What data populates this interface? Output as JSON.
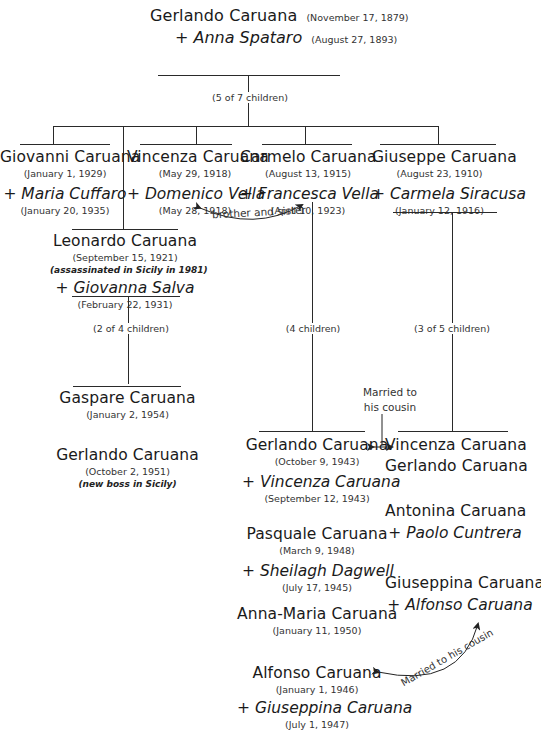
{
  "root": {
    "name": "Gerlando Caruana",
    "date": "(November 17, 1879)",
    "spouse": "+ Anna Spataro",
    "spouse_date": "(August 27, 1893)",
    "children_count": "(5 of 7 children)"
  },
  "generation2": [
    {
      "name": "Giovanni Caruana",
      "date": "(January 1, 1929)",
      "spouse": "+ Maria Cuffaro",
      "spouse_date": "(January 20, 1935)"
    },
    {
      "name": "Vincenza Caruana",
      "date": "(May 29, 1918)",
      "spouse": "+ Domenico Vella",
      "spouse_date": "(May 28, 1918)"
    },
    {
      "name": "Carmelo Caruana",
      "date": "(August 13, 1915)",
      "spouse": "+ Francesca Vella",
      "spouse_date": "(April 10, 1923)",
      "children_count": "(4 children)"
    },
    {
      "name": "Giuseppe Caruana",
      "date": "(August 23, 1910)",
      "spouse": "+ Carmela Siracusa",
      "spouse_date": "(January 12, 1916)",
      "children_count": "(3 of 5 children)"
    },
    {
      "name": "Leonardo Caruana",
      "date": "(September 15, 1921)",
      "note": "(assassinated in Sicily in 1981)",
      "spouse": "+ Giovanna Salva",
      "spouse_date": "(February 22, 1931)",
      "children_count": "(2 of 4 children)"
    }
  ],
  "annotations": {
    "brother_sister": "brother and sister",
    "married_cousin_1_line1": "Married to",
    "married_cousin_1_line2": "his cousin",
    "married_cousin_2": "Married to his cousin"
  },
  "leonardo_children": [
    {
      "name": "Gaspare Caruana",
      "date": "(January 2, 1954)"
    },
    {
      "name": "Gerlando Caruana",
      "date": "(October 2, 1951)",
      "note": "(new boss in Sicily)"
    }
  ],
  "carmelo_children": [
    {
      "name": "Gerlando Caruana",
      "date": "(October 9, 1943)",
      "spouse": "+ Vincenza Caruana",
      "spouse_date": "(September 12, 1943)"
    },
    {
      "name": "Pasquale Caruana",
      "date": "(March 9, 1948)",
      "spouse": "+ Sheilagh Dagwell",
      "spouse_date": "(July 17, 1945)"
    },
    {
      "name": "Anna-Maria Caruana",
      "date": "(January 11, 1950)"
    },
    {
      "name": "Alfonso Caruana",
      "date": "(January 1, 1946)",
      "spouse": "+ Giuseppina Caruana",
      "spouse_date": "(July 1, 1947)"
    }
  ],
  "giuseppe_children": [
    {
      "name": "Vincenza Caruana",
      "spouse_plain": "Gerlando Caruana"
    },
    {
      "name": "Antonina Caruana",
      "spouse": "+ Paolo Cuntrera"
    },
    {
      "name": "Giuseppina Caruana",
      "spouse": "+ Alfonso Caruana"
    }
  ]
}
